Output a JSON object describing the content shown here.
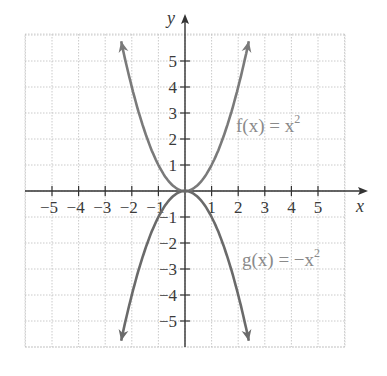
{
  "chart_data": {
    "type": "line",
    "title": "",
    "xlabel": "x",
    "ylabel": "y",
    "xlim": [
      -6,
      6
    ],
    "ylim": [
      -6,
      6
    ],
    "grid": true,
    "x_ticks": [
      -5,
      -4,
      -3,
      -2,
      -1,
      1,
      2,
      3,
      4,
      5
    ],
    "y_ticks": [
      5,
      4,
      3,
      2,
      1,
      -1,
      -2,
      -3,
      -4,
      -5
    ],
    "x_tick_labels": [
      "−5",
      "−4",
      "−3",
      "−2",
      "−1",
      "1",
      "2",
      "3",
      "4",
      "5"
    ],
    "y_tick_labels": [
      "5",
      "4",
      "3",
      "2",
      "1",
      "−1",
      "−2",
      "−3",
      "−4",
      "−5"
    ],
    "series": [
      {
        "name": "f(x) = x^2",
        "label_text": "f(x) = x",
        "label_exp": "2",
        "expression": "x^2",
        "x": [
          -2.4,
          -2,
          -1.5,
          -1,
          -0.5,
          0,
          0.5,
          1,
          1.5,
          2,
          2.4
        ],
        "y": [
          5.76,
          4,
          2.25,
          1,
          0.25,
          0,
          0.25,
          1,
          2.25,
          4,
          5.76
        ],
        "color": "#7a7a7a"
      },
      {
        "name": "g(x) = -x^2",
        "label_text": "g(x) = −x",
        "label_exp": "2",
        "expression": "-x^2",
        "x": [
          -2.4,
          -2,
          -1.5,
          -1,
          -0.5,
          0,
          0.5,
          1,
          1.5,
          2,
          2.4
        ],
        "y": [
          -5.76,
          -4,
          -2.25,
          -1,
          -0.25,
          0,
          -0.25,
          -1,
          -2.25,
          -4,
          -5.76
        ],
        "color": "#6a6a6a"
      }
    ],
    "annotations": [
      {
        "text": "f(x) = x^2",
        "near": [
          2.0,
          2.3
        ]
      },
      {
        "text": "g(x) = −x^2",
        "near": [
          2.2,
          -2.6
        ]
      }
    ],
    "legend": "none"
  },
  "labels": {
    "x_axis": "x",
    "y_axis": "y",
    "f_label": "f(x) = x",
    "f_exp": "2",
    "g_label": "g(x) = −x",
    "g_exp": "2"
  }
}
